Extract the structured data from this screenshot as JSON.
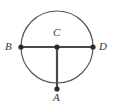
{
  "figure": {
    "type": "circle-geometry-diagram",
    "background_color": "#ffffff",
    "stroke_color": "#4a4a4a",
    "circle_stroke_color": "#555555",
    "label_color": "#3a3a3a",
    "point_color": "#2b2b2b",
    "circle": {
      "center_x": 57,
      "center_y": 47,
      "radius": 36,
      "stroke_width": 1.2
    },
    "segments": [
      {
        "name": "diameter-BD",
        "from": "B",
        "to": "D",
        "x1": 21,
        "y1": 47,
        "x2": 93,
        "y2": 47,
        "stroke_width": 2.2
      },
      {
        "name": "radius-CA",
        "from": "C",
        "to": "A",
        "x1": 57,
        "y1": 47,
        "x2": 57,
        "y2": 89,
        "stroke_width": 2.2
      }
    ],
    "points": [
      {
        "id": "B",
        "label": "B",
        "x": 21,
        "y": 47,
        "radius": 2.6,
        "label_position": "left"
      },
      {
        "id": "C",
        "label": "C",
        "x": 57,
        "y": 47,
        "radius": 2.6,
        "label_position": "above"
      },
      {
        "id": "D",
        "label": "D",
        "x": 93,
        "y": 47,
        "radius": 2.6,
        "label_position": "right"
      },
      {
        "id": "A",
        "label": "A",
        "x": 57,
        "y": 89,
        "radius": 2.6,
        "label_position": "below"
      }
    ]
  }
}
